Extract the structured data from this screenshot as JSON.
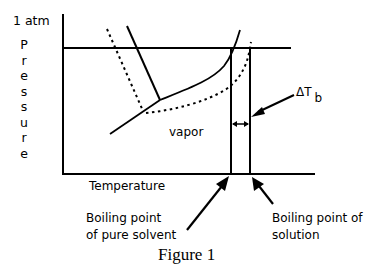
{
  "diagram": {
    "type": "phase-diagram",
    "y_axis": {
      "top_label": "1 atm",
      "letters": [
        "P",
        "r",
        "e",
        "s",
        "s",
        "u",
        "r",
        "e"
      ]
    },
    "x_axis": {
      "label": "Temperature"
    },
    "region_labels": {
      "vapor": "vapor"
    },
    "delta_label": {
      "main": "ΔT",
      "sub": "b"
    },
    "annotations": {
      "pure_solvent": [
        "Boiling point",
        "of pure solvent"
      ],
      "solution": [
        "Boiling point of",
        "solution"
      ]
    },
    "caption": "Figure 1",
    "curves": {
      "pure_solvent": "solid",
      "solution": "dotted"
    }
  }
}
